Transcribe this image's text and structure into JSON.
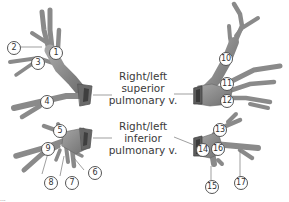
{
  "diagram": {
    "labels": {
      "superior": [
        "Right/left",
        "superior",
        "pulmonary v."
      ],
      "inferior": [
        "Right/left",
        "inferior",
        "pulmonary v."
      ]
    },
    "numbers": [
      "1",
      "2",
      "3",
      "4",
      "5",
      "6",
      "7",
      "8",
      "9",
      "10",
      "11",
      "12",
      "13",
      "14",
      "15",
      "16",
      "17"
    ],
    "colors": {
      "vessel_fill": "#8c8c8c",
      "vessel_dark": "#5e5e5e",
      "vessel_light": "#b0b0b0",
      "leader": "#777777",
      "text": "#3a3a3a"
    },
    "corner_mark": "..."
  }
}
